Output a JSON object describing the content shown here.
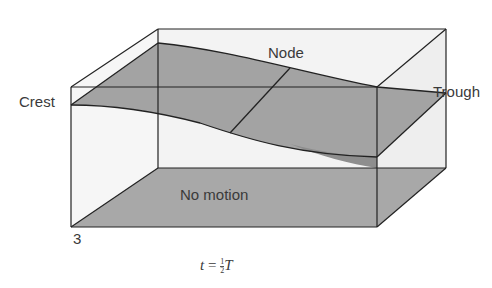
{
  "figure": {
    "type": "3d-box-standing-wave",
    "labels": {
      "crest": "Crest",
      "trough": "Trough",
      "node": "Node",
      "floor": "No motion",
      "panel_number": "3"
    },
    "caption": {
      "variable": "t",
      "equals": "=",
      "fraction_numerator": "1",
      "fraction_denominator": "2",
      "period": "T"
    },
    "colors": {
      "background": "#ffffff",
      "box_face": "#f2f2f2",
      "wave_surface": "#a3a3a3",
      "floor": "#a8a8a8",
      "edge": "#222222",
      "text": "#3a3a3a"
    }
  }
}
